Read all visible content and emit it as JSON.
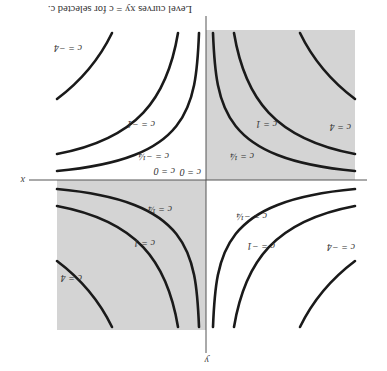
{
  "figure": {
    "orientation": "rotated 180 degrees",
    "caption": "Level curves xy = c for selected c.",
    "axes": {
      "x_label": "x",
      "y_label": "y"
    },
    "shading": {
      "color": "#d4d4d4",
      "quadrants": [
        "first",
        "third"
      ]
    },
    "curve_color": "#1a1a1a",
    "levels": [
      {
        "c": "4",
        "label": "c = 4"
      },
      {
        "c": "1",
        "label": "c = 1"
      },
      {
        "c": "1/4",
        "label": "c = ¼"
      },
      {
        "c": "0",
        "label": "c = 0"
      },
      {
        "c": "-1/4",
        "label": "c = −¼"
      },
      {
        "c": "-1",
        "label": "c = −1"
      },
      {
        "c": "-4",
        "label": "c = −4"
      }
    ],
    "labels": {
      "q1_c4": "c = 4",
      "q1_c1": "c = 1",
      "q1_cq": "c = ¼",
      "q3_c4": "c = 4",
      "q3_c1": "c = 1",
      "q3_cq": "c = ¼",
      "q2_cm4": "c = −4",
      "q2_cm1": "c = −1",
      "q2_cmq": "c = −¼",
      "q4_cm4": "c = −4",
      "q4_cm1": "c = −1",
      "q4_cmq": "c = −¼",
      "c0_a": "c = 0",
      "c0_b": "c = 0"
    }
  }
}
